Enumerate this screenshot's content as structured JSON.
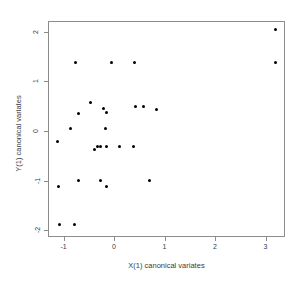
{
  "chart_data": {
    "type": "scatter",
    "title": "",
    "xlabel": "X(1) canonical variates",
    "ylabel": "Y(1) canonical variates",
    "xlim": [
      -1.3,
      3.38
    ],
    "ylim": [
      -2.2,
      2.33
    ],
    "xticks": [
      -1,
      0,
      1,
      2,
      3
    ],
    "xticklabels": [
      "-1",
      "0",
      "1",
      "2",
      "3"
    ],
    "yticks": [
      2,
      1,
      0,
      -1,
      -2
    ],
    "yticklabels": [
      "2",
      "1",
      "0",
      "-1",
      "-2"
    ],
    "grid": false,
    "legend": null,
    "marker": "filled-circle",
    "marker_color": "#000000",
    "points": [
      {
        "x": 3.19,
        "y": 2.05
      },
      {
        "x": 3.19,
        "y": 1.37
      },
      {
        "x": -0.77,
        "y": 1.37
      },
      {
        "x": -0.04,
        "y": 1.37
      },
      {
        "x": 0.4,
        "y": 1.37
      },
      {
        "x": -0.46,
        "y": 0.58
      },
      {
        "x": -0.71,
        "y": 0.36
      },
      {
        "x": -0.2,
        "y": 0.46
      },
      {
        "x": -0.14,
        "y": 0.38
      },
      {
        "x": 0.42,
        "y": 0.49
      },
      {
        "x": 0.58,
        "y": 0.49
      },
      {
        "x": 0.85,
        "y": 0.44
      },
      {
        "x": -0.87,
        "y": 0.06
      },
      {
        "x": -0.16,
        "y": 0.06
      },
      {
        "x": -1.12,
        "y": -0.21
      },
      {
        "x": -0.32,
        "y": -0.31
      },
      {
        "x": -0.26,
        "y": -0.31
      },
      {
        "x": -0.14,
        "y": -0.31
      },
      {
        "x": 0.1,
        "y": -0.31
      },
      {
        "x": 0.38,
        "y": -0.31
      },
      {
        "x": -0.38,
        "y": -0.38
      },
      {
        "x": -1.1,
        "y": -1.11
      },
      {
        "x": -0.71,
        "y": -1.0
      },
      {
        "x": -0.26,
        "y": -1.0
      },
      {
        "x": -0.14,
        "y": -1.11
      },
      {
        "x": 0.71,
        "y": -1.0
      },
      {
        "x": -1.07,
        "y": -1.88
      },
      {
        "x": -0.79,
        "y": -1.88
      }
    ]
  }
}
